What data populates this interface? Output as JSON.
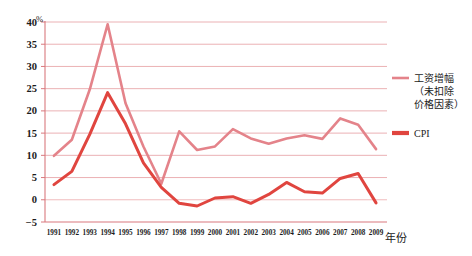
{
  "chart_data": {
    "type": "line",
    "title": "",
    "xlabel": "年份",
    "ylabel": "",
    "unit_label": "%",
    "grid": true,
    "legend_position": "right",
    "ylim": [
      -5,
      40
    ],
    "ytick_step": 5,
    "yticks": [
      40,
      35,
      30,
      25,
      20,
      15,
      10,
      5,
      0,
      -5
    ],
    "ytick_labels": [
      "40",
      "35",
      "30",
      "25",
      "20",
      "15",
      "10",
      "5",
      "0",
      "−5"
    ],
    "categories": [
      "1991",
      "1992",
      "1993",
      "1994",
      "1995",
      "1996",
      "1997",
      "1998",
      "1999",
      "2000",
      "2001",
      "2002",
      "2003",
      "2004",
      "2005",
      "2006",
      "2007",
      "2008",
      "2009"
    ],
    "series": [
      {
        "name": "工资增幅（未扣除价格因素）",
        "color": "#e4838a",
        "values": [
          9.9,
          13.5,
          24.8,
          39.5,
          21.7,
          12.0,
          3.6,
          15.4,
          11.2,
          12.0,
          15.9,
          13.8,
          12.6,
          13.8,
          14.5,
          13.7,
          18.3,
          16.9,
          11.4
        ]
      },
      {
        "name": "CPI",
        "color": "#e0453f",
        "values": [
          3.4,
          6.4,
          14.7,
          24.1,
          17.1,
          8.3,
          2.8,
          -0.8,
          -1.4,
          0.4,
          0.7,
          -0.8,
          1.2,
          3.9,
          1.8,
          1.5,
          4.8,
          5.9,
          -0.7
        ]
      }
    ],
    "legend": [
      {
        "label": "工资增幅",
        "sub_lines": [
          "（未扣除",
          "价格因素）"
        ],
        "color": "#e4838a",
        "style": "thin-line"
      },
      {
        "label": "CPI",
        "sub_lines": [],
        "color": "#e0453f",
        "style": "thick-line"
      }
    ]
  },
  "colors": {
    "wage_line": "#e4838a",
    "cpi_line": "#e0453f",
    "gridline": "#e9a8ab",
    "axis": "#d9797e",
    "zero_line": "#eeb4b6",
    "text": "#1c1c1c",
    "background": "#ffffff"
  }
}
